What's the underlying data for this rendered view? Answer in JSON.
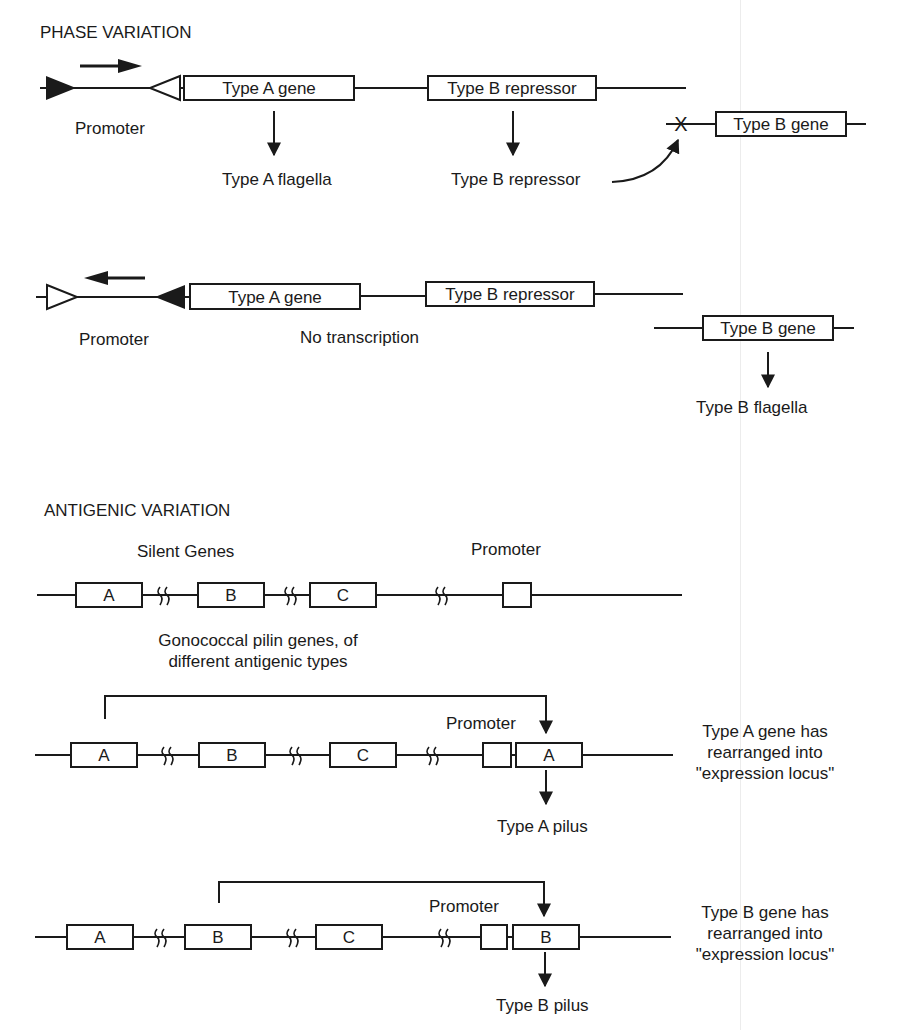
{
  "phase_variation": {
    "title": "PHASE VARIATION",
    "state_on": {
      "promoter_label": "Promoter",
      "type_a_gene": "Type A gene",
      "type_b_repressor": "Type B repressor",
      "type_a_product": "Type A flagella",
      "type_b_repressor_product": "Type B repressor",
      "type_b_gene": "Type B gene",
      "blocked_marker": "X"
    },
    "state_off": {
      "promoter_label": "Promoter",
      "type_a_gene": "Type A gene",
      "type_b_repressor": "Type B repressor",
      "no_transcription": "No transcription",
      "type_b_gene": "Type B gene",
      "type_b_product": "Type B flagella"
    }
  },
  "antigenic_variation": {
    "title": "ANTIGENIC VARIATION",
    "silent_genes_label": "Silent Genes",
    "promoter_label": "Promoter",
    "caption_line1": "Gonococcal pilin genes, of",
    "caption_line2": "different antigenic types",
    "genes": [
      "A",
      "B",
      "C"
    ],
    "rearrangement_a": {
      "promoter_label": "Promoter",
      "expressed_gene": "A",
      "product": "Type A pilus",
      "note_line1": "Type A gene has",
      "note_line2": "rearranged into",
      "note_line3": "\"expression locus\""
    },
    "rearrangement_b": {
      "promoter_label": "Promoter",
      "expressed_gene": "B",
      "product": "Type B pilus",
      "note_line1": "Type B gene has",
      "note_line2": "rearranged into",
      "note_line3": "\"expression locus\""
    }
  }
}
